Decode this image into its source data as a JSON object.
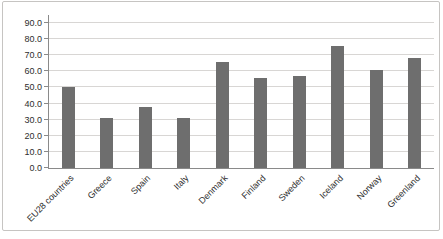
{
  "window": {
    "background": "#ffffff",
    "frame_border_color": "#c6c4c2"
  },
  "chart_data": {
    "type": "bar",
    "title": "",
    "xlabel": "",
    "ylabel": "",
    "categories": [
      "EU28 countries",
      "Greece",
      "Spain",
      "Italy",
      "Denmark",
      "Finland",
      "Sweden",
      "Iceland",
      "Norway",
      "Greenland"
    ],
    "values": [
      50,
      31,
      38,
      31,
      66,
      56,
      57,
      76,
      61,
      68
    ],
    "ylim": [
      0,
      90
    ],
    "ytick_step": 10,
    "ytick_labels": [
      "0.0",
      "10.0",
      "20.0",
      "30.0",
      "40.0",
      "50.0",
      "60.0",
      "70.0",
      "80.0",
      "90.0"
    ],
    "grid": true,
    "legend": false,
    "bar_color": "#6e6e6e",
    "gridline_color": "#d8d6d4",
    "axis_color": "#8a8a8a",
    "tick_label_color": "#2e2e2e"
  }
}
